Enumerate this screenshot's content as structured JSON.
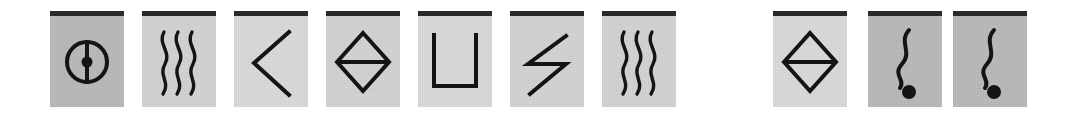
{
  "figure": {
    "background_color": "#ffffff",
    "card_width_px": 74,
    "card_height_px": 96,
    "top_bar_color": "#2b2b2b",
    "symbol_color": "#141414"
  },
  "groups": [
    {
      "name": "left-group",
      "left_px": 50,
      "card_count": 7,
      "cards": [
        {
          "index": 1,
          "icon": "circle-with-vertical-line-and-dot-icon",
          "label": "circle-crosshair-dot",
          "left_px": 50,
          "background_color": "#bcbcbc",
          "shade": "shade-dark"
        },
        {
          "index": 2,
          "icon": "triple-wavy-lines-icon",
          "label": "triple-wave",
          "left_px": 142,
          "background_color": "#d5d5d5",
          "shade": "shade-mid"
        },
        {
          "index": 3,
          "icon": "chevron-left-icon",
          "label": "open-angle",
          "left_px": 234,
          "background_color": "#dcdcdc",
          "shade": "shade-light"
        },
        {
          "index": 4,
          "icon": "diamond-with-horizontal-line-icon",
          "label": "bisected-diamond",
          "left_px": 326,
          "background_color": "#d5d5d5",
          "shade": "shade-mid"
        },
        {
          "index": 5,
          "icon": "u-bracket-icon",
          "label": "u-shape",
          "left_px": 418,
          "background_color": "#dcdcdc",
          "shade": "shade-light"
        },
        {
          "index": 6,
          "icon": "zigzag-lightning-icon",
          "label": "z-zigzag",
          "left_px": 510,
          "background_color": "#d5d5d5",
          "shade": "shade-mid"
        },
        {
          "index": 7,
          "icon": "triple-wavy-lines-icon",
          "label": "triple-wave",
          "left_px": 602,
          "background_color": "#d5d5d5",
          "shade": "shade-mid"
        }
      ]
    },
    {
      "name": "right-group",
      "left_px": 773,
      "card_count": 3,
      "cards": [
        {
          "index": 8,
          "icon": "diamond-with-horizontal-line-icon",
          "label": "bisected-diamond",
          "left_px": 773,
          "background_color": "#dcdcdc",
          "shade": "shade-light"
        },
        {
          "index": 9,
          "icon": "wavy-line-with-dot-icon",
          "label": "tadpole-wave-dot",
          "left_px": 868,
          "background_color": "#bcbcbc",
          "shade": "shade-dark"
        },
        {
          "index": 10,
          "icon": "wavy-line-with-dot-icon",
          "label": "tadpole-wave-dot",
          "left_px": 953,
          "background_color": "#bcbcbc",
          "shade": "shade-dark"
        }
      ]
    }
  ]
}
